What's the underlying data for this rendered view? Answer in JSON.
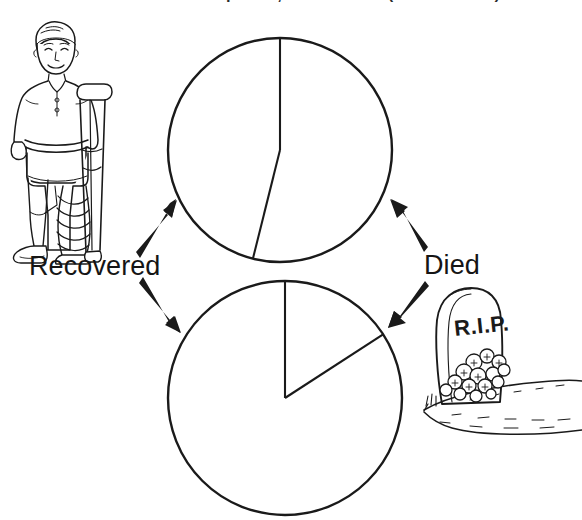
{
  "title": "Before antiseptics, 1864-66 (35 cases)",
  "labels": {
    "recovered": "Recovered",
    "died": "Died"
  },
  "illustrations": {
    "survivor": {
      "name": "injured-person-with-crutch",
      "description": "line drawing of a standing boy with a bandaged leg holding a crutch"
    },
    "grave": {
      "name": "gravestone-with-flowers",
      "inscription": "R.I.P.",
      "description": "line drawing of a rounded headstone with flowers at its base on sloping ground"
    }
  },
  "arrows": {
    "recovered_to_top": "arrow-up-right",
    "recovered_to_bottom": "arrow-down-right",
    "died_to_top": "arrow-up-left",
    "died_to_bottom": "arrow-down-left"
  },
  "chart_data": {
    "type": "pie",
    "title": "Before antiseptics, 1864-66 (35 cases)",
    "charts": [
      {
        "id": "top-pie",
        "name": "before-antiseptics-pie",
        "caption": "Before antiseptics, 1864-66 (35 cases)",
        "cases": 35,
        "start_angle_deg": 0,
        "labels": [
          "Recovered",
          "Died"
        ],
        "values": [
          19,
          16
        ],
        "percentages": [
          54,
          46
        ],
        "slice_angles_deg": [
          194,
          166
        ],
        "center": [
          280,
          150
        ],
        "radius": 112,
        "colors": [
          "#ffffff",
          "#ffffff"
        ],
        "stroke": "#1a1a1a"
      },
      {
        "id": "bottom-pie",
        "name": "after-antiseptics-pie",
        "caption": "After antiseptics",
        "cases": 40,
        "start_angle_deg": 0,
        "labels": [
          "Died",
          "Recovered"
        ],
        "values": [
          6,
          34
        ],
        "percentages": [
          16,
          84
        ],
        "slice_angles_deg": [
          57,
          303
        ],
        "center": [
          285,
          398
        ],
        "radius": 117,
        "colors": [
          "#ffffff",
          "#ffffff"
        ],
        "stroke": "#1a1a1a"
      }
    ],
    "legend_position": "outside-left-and-right",
    "grid": false
  }
}
